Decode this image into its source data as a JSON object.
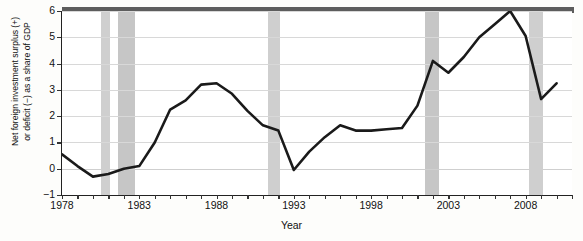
{
  "chart_data": {
    "type": "line",
    "title": "",
    "xlabel": "Year",
    "ylabel": "Net foreign investment surplus (+)\nor deficit (−) as a share of GDP",
    "xlim": [
      1978,
      2011
    ],
    "ylim": [
      -1,
      6
    ],
    "ytick_labels": [
      "6",
      "5",
      "4",
      "3",
      "2",
      "1",
      "0",
      "−1"
    ],
    "ytick_values": [
      6,
      5,
      4,
      3,
      2,
      1,
      0,
      -1
    ],
    "xtick_labels": [
      "1978",
      "1983",
      "1988",
      "1993",
      "1998",
      "2003",
      "2008"
    ],
    "xtick_values": [
      1978,
      1983,
      1988,
      1993,
      1998,
      2003,
      2008
    ],
    "grid": "horizontal",
    "legend": "none",
    "series": [
      {
        "name": "Net foreign investment as a share of GDP",
        "color": "#1a1a1a",
        "x": [
          1978,
          1979,
          1980,
          1981,
          1982,
          1983,
          1984,
          1985,
          1986,
          1987,
          1988,
          1989,
          1990,
          1991,
          1992,
          1993,
          1994,
          1995,
          1996,
          1997,
          1998,
          1999,
          2000,
          2001,
          2002,
          2003,
          2004,
          2005,
          2006,
          2007,
          2008,
          2009,
          2010
        ],
        "values": [
          0.55,
          0.1,
          -0.3,
          -0.2,
          0.0,
          0.1,
          1.0,
          2.25,
          2.6,
          3.2,
          3.25,
          2.85,
          2.2,
          1.65,
          1.45,
          -0.05,
          0.65,
          1.2,
          1.65,
          1.45,
          1.45,
          1.5,
          1.55,
          2.4,
          4.1,
          3.65,
          4.25,
          5.0,
          5.5,
          6.0,
          5.05,
          2.65,
          3.25
        ]
      }
    ],
    "recession_bands": [
      {
        "label": "1980 recession",
        "start": 1980.55,
        "end": 1981.1,
        "color": "#cfcfcf"
      },
      {
        "label": "1981-82 recession",
        "start": 1981.6,
        "end": 1982.7,
        "color": "#c6c6c6"
      },
      {
        "label": "1990-91 recession",
        "start": 1991.35,
        "end": 1992.1,
        "color": "#cfcfcf"
      },
      {
        "label": "2001 recession",
        "start": 2001.5,
        "end": 2002.4,
        "color": "#c6c6c6"
      },
      {
        "label": "2008-09 recession",
        "start": 2008.2,
        "end": 2009.1,
        "color": "#cfcfcf"
      }
    ]
  },
  "axes": {
    "y_title_line1": "Net foreign investment surplus (+)",
    "y_title_line2": "or deficit (−) as a share of GDP",
    "x_title": "Year"
  }
}
